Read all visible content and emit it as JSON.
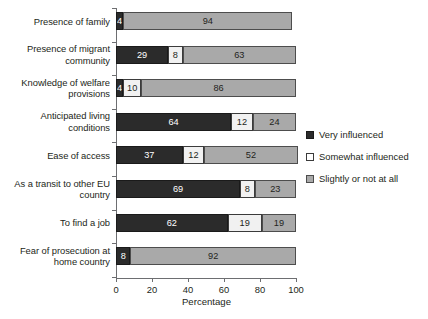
{
  "chart_data": {
    "type": "bar",
    "orientation": "horizontal",
    "stacked": true,
    "title": "",
    "xlabel": "Percentage",
    "ylabel": "",
    "xlim": [
      0,
      100
    ],
    "xticks": [
      0,
      20,
      40,
      60,
      80,
      100
    ],
    "grid": false,
    "legend_position": "right",
    "categories": [
      "Presence of family",
      "Presence of migrant community",
      "Knowledge of welfare provisions",
      "Anticipated living conditions",
      "Ease of access",
      "As a transit to other EU country",
      "To find a job",
      "Fear of prosecution at home country"
    ],
    "series": [
      {
        "name": "Very influenced",
        "color": "#2b2b2b",
        "values": [
          4,
          29,
          4,
          64,
          37,
          69,
          62,
          8
        ]
      },
      {
        "name": "Somewhat influenced",
        "color": "#f1f1f1",
        "values": [
          0,
          8,
          10,
          12,
          12,
          8,
          19,
          0
        ]
      },
      {
        "name": "Slightly or not at all",
        "color": "#a9a9a9",
        "values": [
          94,
          63,
          86,
          24,
          52,
          23,
          19,
          92
        ]
      }
    ]
  },
  "axis": {
    "x_title": "Percentage",
    "x_tick_labels": [
      "0",
      "20",
      "40",
      "60",
      "80",
      "100"
    ]
  },
  "legend": {
    "items": [
      {
        "label": "Very influenced",
        "swatch": "swatch-very-influenced"
      },
      {
        "label": "Somewhat influenced",
        "swatch": "swatch-somewhat-influenced"
      },
      {
        "label": "Slightly or not at all",
        "swatch": "swatch-slightly-or-not-at-all"
      }
    ]
  }
}
